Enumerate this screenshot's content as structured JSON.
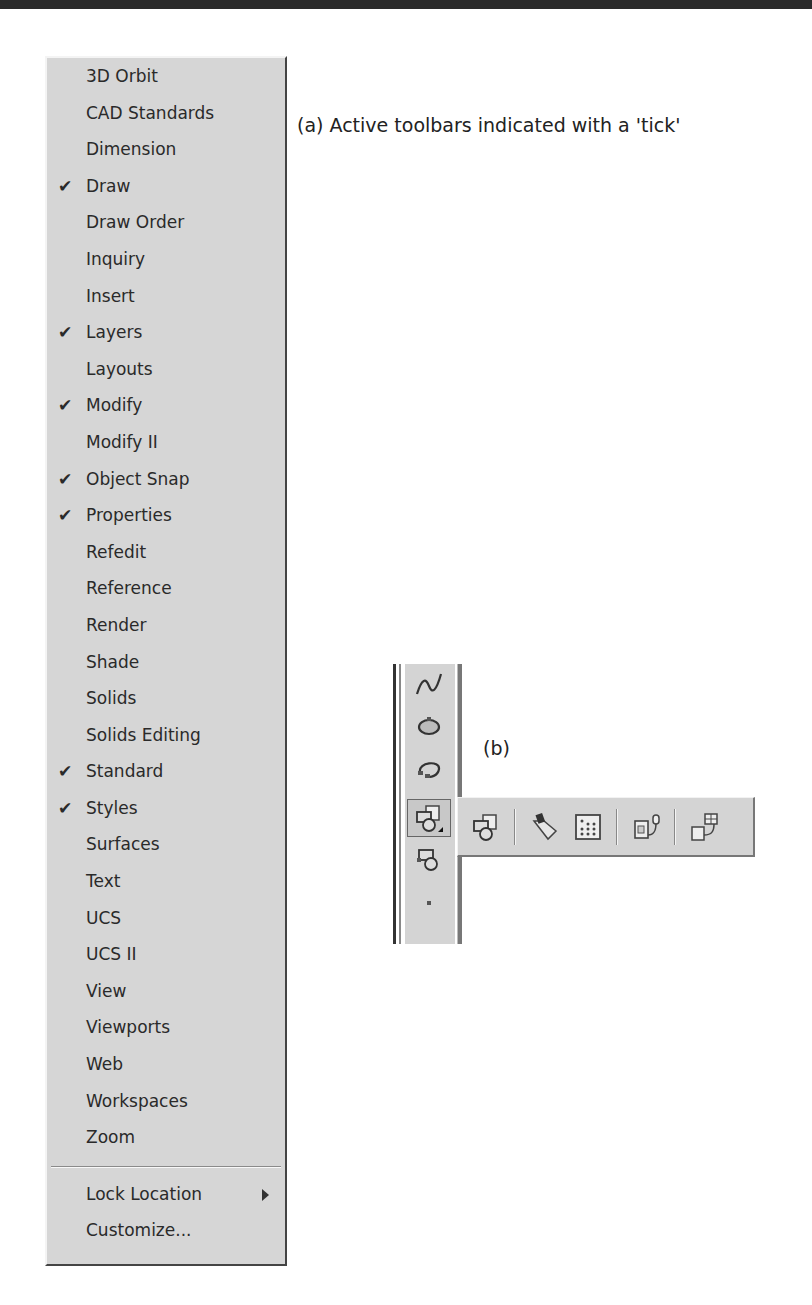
{
  "captions": {
    "a": "(a) Active toolbars indicated with a 'tick'",
    "b": "(b)"
  },
  "menu": {
    "items": [
      {
        "label": "3D Orbit",
        "checked": false
      },
      {
        "label": "CAD Standards",
        "checked": false
      },
      {
        "label": "Dimension",
        "checked": false
      },
      {
        "label": "Draw",
        "checked": true
      },
      {
        "label": "Draw Order",
        "checked": false
      },
      {
        "label": "Inquiry",
        "checked": false
      },
      {
        "label": "Insert",
        "checked": false
      },
      {
        "label": "Layers",
        "checked": true
      },
      {
        "label": "Layouts",
        "checked": false
      },
      {
        "label": "Modify",
        "checked": true
      },
      {
        "label": "Modify II",
        "checked": false
      },
      {
        "label": "Object Snap",
        "checked": true
      },
      {
        "label": "Properties",
        "checked": true
      },
      {
        "label": "Refedit",
        "checked": false
      },
      {
        "label": "Reference",
        "checked": false
      },
      {
        "label": "Render",
        "checked": false
      },
      {
        "label": "Shade",
        "checked": false
      },
      {
        "label": "Solids",
        "checked": false
      },
      {
        "label": "Solids Editing",
        "checked": false
      },
      {
        "label": "Standard",
        "checked": true
      },
      {
        "label": "Styles",
        "checked": true
      },
      {
        "label": "Surfaces",
        "checked": false
      },
      {
        "label": "Text",
        "checked": false
      },
      {
        "label": "UCS",
        "checked": false
      },
      {
        "label": "UCS II",
        "checked": false
      },
      {
        "label": "View",
        "checked": false
      },
      {
        "label": "Viewports",
        "checked": false
      },
      {
        "label": "Web",
        "checked": false
      },
      {
        "label": "Workspaces",
        "checked": false
      },
      {
        "label": "Zoom",
        "checked": false
      }
    ],
    "tick_glyph": "✔",
    "lock_location": "Lock Location",
    "customize": "Customize..."
  },
  "vertical_toolbar": {
    "buttons": [
      "spline-icon",
      "ellipse-icon",
      "ellipse-arc-icon",
      "insert-block-icon",
      "make-block-icon",
      "point-icon"
    ]
  },
  "flyout_toolbar": {
    "buttons": [
      "insert-block-icon",
      "hatch-brush-icon",
      "gradient-icon",
      "external-reference-icon",
      "table-link-icon"
    ]
  }
}
